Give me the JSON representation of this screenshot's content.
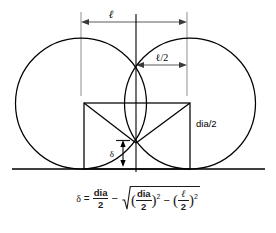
{
  "figure": {
    "background_color": "#ffffff",
    "line_color": "#000000",
    "extension_line_color": "#9a9a9a",
    "dimension_line_color": "#3a3a3a",
    "labels": {
      "length_overall": "ℓ",
      "length_half": "ℓ/2",
      "diameter_half": "dia/2",
      "delta": "δ"
    }
  },
  "formula": {
    "lhs_symbol": "δ",
    "equals": "=",
    "term1_numerator": "dia",
    "term1_denominator": "2",
    "minus": "−",
    "radical_open_paren": "(",
    "term2_numerator": "dia",
    "term2_denominator": "2",
    "radical_close_paren": ")",
    "exponent1": "2",
    "inner_minus": "−",
    "term3_open_paren": "(",
    "term3_numerator": "ℓ",
    "term3_denominator": "2",
    "term3_close_paren": ")",
    "exponent2": "2",
    "plain_text": "δ = dia/2 − √((dia/2)² − (ℓ/2)²)"
  },
  "geometry": {
    "circle_left": {
      "cx": 81,
      "cy": 103.5,
      "r": 65.5
    },
    "circle_right": {
      "cx": 190,
      "cy": 103.5,
      "r": 65.5
    },
    "ground_line": {
      "x1": 12,
      "y1": 169,
      "x2": 265,
      "y2": 169
    },
    "center_line": {
      "x": 136,
      "y1": 14,
      "y2": 172
    },
    "square": {
      "left": 84,
      "top": 103,
      "right": 190,
      "bottom": 169
    },
    "intersection_upper": {
      "x": 136,
      "y": 62
    },
    "intersection_lower": {
      "x": 136,
      "y": 143
    },
    "dim_ell": {
      "y": 22,
      "x1": 81,
      "x2": 187
    },
    "dim_ell_half": {
      "y": 65,
      "x1": 136,
      "x2": 187
    },
    "dim_delta": {
      "x": 123,
      "y1": 140,
      "y2": 167
    },
    "extension_left": {
      "x": 81,
      "y1": 12,
      "y2": 96
    },
    "extension_right": {
      "x": 187,
      "y1": 12,
      "y2": 96
    }
  }
}
